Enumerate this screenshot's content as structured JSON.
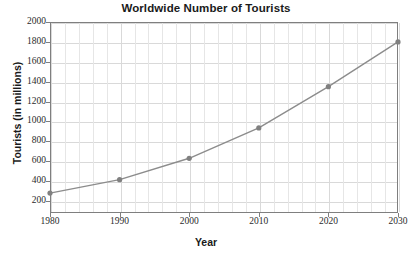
{
  "chart_data": {
    "type": "line",
    "title": "Worldwide Number of Tourists",
    "xlabel": "Year",
    "ylabel": "Tourists (in millions)",
    "x": [
      1980,
      1990,
      2000,
      2010,
      2020,
      2030
    ],
    "values": [
      280,
      415,
      630,
      935,
      1350,
      1800
    ],
    "series": [
      {
        "name": "Worldwide tourists",
        "values": [
          280,
          415,
          630,
          935,
          1350,
          1800
        ]
      }
    ],
    "xlim": [
      1980,
      2030
    ],
    "ylim": [
      80,
      2000
    ],
    "xticks": [
      1980,
      1990,
      2000,
      2010,
      2020,
      2030
    ],
    "xtick_labels": [
      "1980",
      "1990",
      "2000",
      "2010",
      "2020",
      "2030"
    ],
    "yticks": [
      200,
      400,
      600,
      800,
      1000,
      1200,
      1400,
      1600,
      1800,
      2000
    ],
    "ytick_labels": [
      "200",
      "400",
      "600",
      "800",
      "1000",
      "1200",
      "1400",
      "1600",
      "1800",
      "2000"
    ],
    "x_minor_step": 2,
    "grid": true,
    "legend": "none",
    "line_color": "#8c8c8c",
    "marker_color": "#808080",
    "grid_color": "#d9d9d9",
    "frame_color": "#7f7f7f",
    "background": "#ffffff"
  }
}
